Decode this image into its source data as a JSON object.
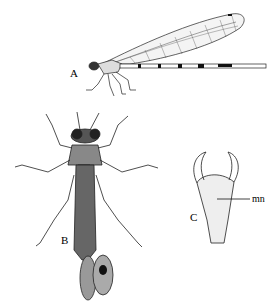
{
  "figure": {
    "panels": [
      {
        "id": "A",
        "label": "A",
        "description": "Adult damselfly, lateral view"
      },
      {
        "id": "B",
        "label": "B",
        "description": "Nymph (larva), dorsal view"
      },
      {
        "id": "C",
        "label": "C",
        "description": "Labium (mask) of nymph"
      }
    ],
    "annotations": [
      {
        "panel": "C",
        "text": "mn"
      }
    ]
  }
}
